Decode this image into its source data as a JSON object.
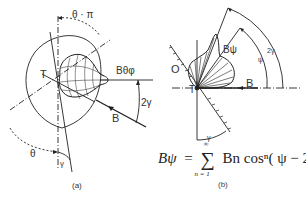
{
  "panel_a": {
    "caption": "(a)",
    "labels": {
      "theta_pi": "θ · π",
      "T": "T",
      "B_theta_phi": "Bθφ",
      "two_gamma": "2γ",
      "B": "B",
      "theta": "θ",
      "gamma": "γ"
    }
  },
  "panel_b": {
    "caption": "(b)",
    "labels": {
      "O": "O",
      "T": "T",
      "B_psi": "Bψ",
      "B": "B",
      "two_gamma": "2γ",
      "psi": "ψ",
      "gamma": "γ"
    },
    "formula": {
      "lhs": "Bψ",
      "equals": "=",
      "sum_upper": "∞",
      "sum_lower": "n = 1",
      "term": "Bn cosⁿ( ψ − 2γ)"
    }
  },
  "colors": {
    "line": "#222222",
    "text": "#333333",
    "background": "#ffffff"
  }
}
